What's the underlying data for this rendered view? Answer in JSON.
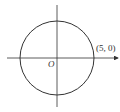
{
  "diagram": {
    "title": "",
    "origin_label": "O",
    "point_label": "(5, 0)",
    "circle": {
      "center": [
        0,
        0
      ],
      "radius": 5
    },
    "axes": {
      "x_arrow": true,
      "y_arrow": false
    },
    "colors": {
      "stroke": "#333333",
      "background": "#ffffff"
    }
  }
}
